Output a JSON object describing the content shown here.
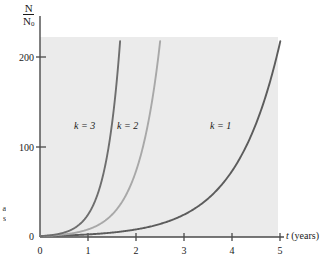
{
  "chart_data": {
    "type": "line",
    "title": "",
    "subtitle": "",
    "xlabel": "t (years)",
    "xlabel_variable": "t",
    "xlabel_units": "(years)",
    "ylabel": "N/N0",
    "ylabel_numerator": "N",
    "ylabel_denominator": "N",
    "ylabel_denominator_sub": "0",
    "xlim": [
      0,
      5.5
    ],
    "ylim": [
      0,
      230
    ],
    "xticks": [
      0,
      1,
      2,
      3,
      4,
      5
    ],
    "xtick_labels": [
      "0",
      "1",
      "2",
      "3",
      "4",
      "5"
    ],
    "yticks": [
      0,
      100,
      200
    ],
    "ytick_labels": [
      "0",
      "100",
      "200"
    ],
    "grid": false,
    "legend_position": "inline-annotations",
    "plot_background": "#ebebeb",
    "axis_color": "#4a4a4a",
    "series": [
      {
        "name": "k = 1",
        "k": 1,
        "equation": "N/N0 = e^(1t)",
        "color": "#5c5c5c",
        "label": "k = 1",
        "label_x": 4.3,
        "label_y": 120,
        "x": [
          0,
          0.5,
          1,
          1.5,
          2,
          2.5,
          3,
          3.5,
          4,
          4.5,
          5,
          5.44
        ],
        "values": [
          1,
          1.6,
          2.7,
          4.5,
          7.4,
          12.2,
          20.1,
          33.1,
          54.6,
          90.0,
          148.4,
          230.0
        ]
      },
      {
        "name": "k = 2",
        "k": 2,
        "equation": "N/N0 = e^(2t)",
        "color": "#a8a8a8",
        "label": "k = 2",
        "label_x": 1.8,
        "label_y": 120,
        "x": [
          0,
          0.25,
          0.5,
          0.75,
          1,
          1.25,
          1.5,
          1.75,
          2,
          2.25,
          2.5,
          2.72
        ],
        "values": [
          1,
          1.6,
          2.7,
          4.5,
          7.4,
          12.2,
          20.1,
          33.1,
          54.6,
          90.0,
          148.4,
          230.0
        ]
      },
      {
        "name": "k = 3",
        "k": 3,
        "equation": "N/N0 = e^(3t)",
        "color": "#6e6e6e",
        "label": "k = 3",
        "label_x": 0.95,
        "label_y": 120,
        "x": [
          0,
          0.17,
          0.33,
          0.5,
          0.67,
          0.83,
          1,
          1.17,
          1.33,
          1.5,
          1.67,
          1.81
        ],
        "values": [
          1,
          1.6,
          2.7,
          4.5,
          7.4,
          12.2,
          20.1,
          33.1,
          54.6,
          90.0,
          148.4,
          230.0
        ]
      }
    ]
  },
  "caption_fragment": {
    "line1": "a",
    "line2": "s"
  }
}
